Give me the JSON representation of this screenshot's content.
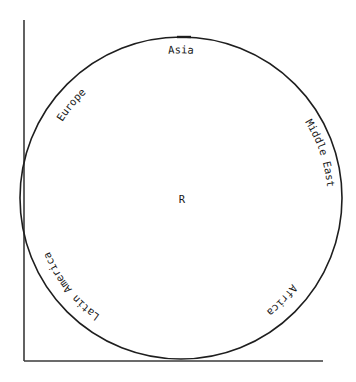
{
  "diagram": {
    "center_label": "R",
    "regions": [
      {
        "name": "Asia"
      },
      {
        "name": "Middle East"
      },
      {
        "name": "Africa"
      },
      {
        "name": "Latin America"
      },
      {
        "name": "Europe"
      }
    ],
    "colors": {
      "line": "#1e1e1e",
      "axis": "#3a3a3a",
      "background": "#ffffff"
    }
  }
}
